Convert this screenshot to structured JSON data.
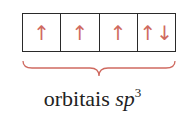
{
  "diagram": {
    "orbitals": [
      {
        "electrons": "↑"
      },
      {
        "electrons": "↑"
      },
      {
        "electrons": "↑"
      },
      {
        "electrons": "↑↓"
      }
    ],
    "label": {
      "word": "orbitais",
      "hybrid": "sp",
      "superscript": "3"
    },
    "colors": {
      "arrow": "#cf6a60",
      "brace": "#cf6a60",
      "box_border": "#2a2a2a"
    }
  }
}
